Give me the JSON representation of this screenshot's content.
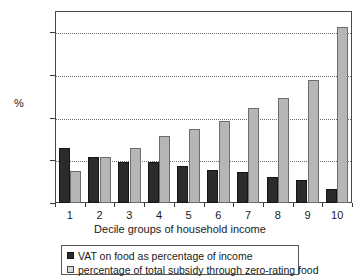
{
  "chart_data": {
    "type": "bar",
    "title": "",
    "subtitle": "",
    "xlabel": "Decile groups of household income",
    "ylabel": "%",
    "categories": [
      "1",
      "2",
      "3",
      "4",
      "5",
      "6",
      "7",
      "8",
      "9",
      "10"
    ],
    "series": [
      {
        "name": "VAT on food as percentage of income",
        "color": "#2b2b2b",
        "values": [
          6.5,
          5.4,
          4.85,
          4.8,
          4.3,
          3.9,
          3.6,
          3.1,
          2.65,
          1.7
        ]
      },
      {
        "name": "percentage of total subsidy through zero-rating food",
        "color": "#b6b6b6",
        "values": [
          3.7,
          5.4,
          6.4,
          7.9,
          8.7,
          9.6,
          11.1,
          12.3,
          14.4,
          20.6
        ]
      }
    ],
    "ylim": [
      0,
      22.5
    ],
    "yticks": [
      0,
      5,
      10,
      15,
      20
    ],
    "ytick_labels": [
      "0",
      "5",
      "10",
      "15",
      "20"
    ],
    "grid": true,
    "grid_axis": "y",
    "legend_position": "bottom",
    "bar_group_count": 10,
    "bars_per_group": 2
  },
  "axes": {
    "y_title": "%",
    "x_title": "Decile groups of household income"
  },
  "legend": {
    "items": [
      {
        "label": "VAT on food as percentage of income",
        "swatch": "dark"
      },
      {
        "label": "percentage of total subsidy through zero-rating food",
        "swatch": "light"
      }
    ]
  },
  "colors": {
    "series_dark": "#2b2b2b",
    "series_light": "#b6b6b6",
    "axis": "#4a4a4a",
    "grid": "#6f6f6f",
    "text": "#1a1a1a",
    "background": "#ffffff"
  }
}
